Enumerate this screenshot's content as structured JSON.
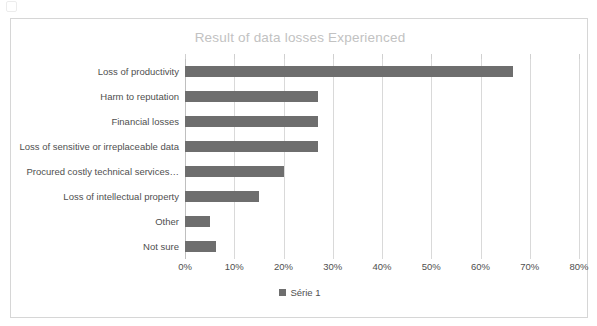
{
  "page": {
    "background_color": "#ffffff",
    "artifact_name": "scan-speck"
  },
  "chart_frame": {
    "border_color": "#d6d6d6"
  },
  "chart_data": {
    "type": "bar",
    "orientation": "horizontal",
    "title": "Result of data losses Experienced",
    "xlabel": "",
    "ylabel": "",
    "xlim": [
      0,
      80
    ],
    "xtick_step": 10,
    "xticks": [
      "0%",
      "10%",
      "20%",
      "30%",
      "40%",
      "50%",
      "60%",
      "70%",
      "80%"
    ],
    "xtick_values": [
      0,
      10,
      20,
      30,
      40,
      50,
      60,
      70,
      80
    ],
    "grid": "vertical",
    "legend_position": "bottom",
    "categories": [
      "Loss of productivity",
      "Harm to reputation",
      "Financial losses",
      "Loss of sensitive or irreplaceable data",
      "Procured costly technical services…",
      "Loss of intellectual property",
      "Other",
      "Not sure"
    ],
    "series": [
      {
        "name": "Série 1",
        "color": "#6e6e6e",
        "values": [
          66.5,
          27,
          27,
          27,
          20,
          15,
          5,
          6.2
        ]
      }
    ]
  },
  "legend": {
    "entries": [
      {
        "label": "Série 1",
        "color": "#6e6e6e"
      }
    ]
  },
  "colors": {
    "bar": "#6e6e6e",
    "gridline": "#d9d9d9",
    "axis": "#bfbfbf",
    "title": "#c2c2c2",
    "text": "#4f4f4f"
  }
}
